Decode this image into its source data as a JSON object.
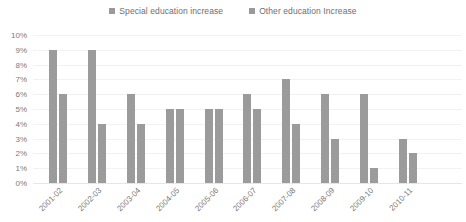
{
  "chart_data": {
    "type": "bar",
    "title": "",
    "subtitle": "",
    "xlabel": "",
    "ylabel": "",
    "categories": [
      "2001-02",
      "2002-03",
      "2003-04",
      "2004-05",
      "2005-06",
      "2006-07",
      "2007-08",
      "2008-09",
      "2009-10",
      "2010-11"
    ],
    "series": [
      {
        "name": "Special education increase",
        "color": "#9b9b9b",
        "values": [
          9,
          9,
          6,
          5,
          5,
          6,
          7,
          6,
          6,
          3
        ]
      },
      {
        "name": "Other education Increase",
        "color": "#9b9b9b",
        "values": [
          6,
          4,
          4,
          5,
          5,
          5,
          4,
          3,
          1,
          2
        ]
      }
    ],
    "ylim": [
      0,
      10
    ],
    "ytick_values": [
      10,
      9,
      8,
      7,
      6,
      5,
      4,
      3,
      2,
      1,
      0
    ],
    "ytick_labels": [
      "10%",
      "9%",
      "8%",
      "7%",
      "6%",
      "5%",
      "4%",
      "3%",
      "2%",
      "1%",
      "0%"
    ],
    "grid": true,
    "legend_position": "top-center",
    "value_suffix": "%"
  },
  "legend": {
    "entries": [
      {
        "label": "Special education increase",
        "swatch_name": "legend-swatch-special"
      },
      {
        "label": "Other education Increase",
        "swatch_name": "legend-swatch-other"
      }
    ]
  },
  "colors": {
    "bar": "#9b9b9b",
    "gridline": "#f2f2f2",
    "baseline": "#e6e6e6",
    "tick_text": "#7a7a7a",
    "legend_text": "#6e6e6e",
    "background": "#ffffff"
  }
}
